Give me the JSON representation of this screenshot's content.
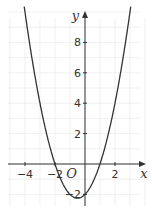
{
  "chart_data": {
    "type": "line",
    "title": "",
    "xlabel": "x",
    "ylabel": "y",
    "origin_label": "O",
    "function": "y = x^2 + x - 2",
    "xlim": [
      -5,
      3.5
    ],
    "ylim": [
      -3,
      10
    ],
    "grid": true,
    "x_ticks": [
      -4,
      -2,
      2
    ],
    "x_tick_labels": [
      "−4",
      "−2",
      "2"
    ],
    "y_ticks": [
      -2,
      2,
      4,
      6,
      8
    ],
    "y_tick_labels": [
      "−2",
      "2",
      "4",
      "6",
      "8"
    ],
    "key_points": {
      "roots": [
        -2,
        1
      ],
      "y_intercept": -2,
      "vertex": [
        -0.5,
        -2.25
      ]
    },
    "colors": {
      "curve": "#333333",
      "axes": "#333333",
      "grid": "#e6e6e6"
    }
  }
}
